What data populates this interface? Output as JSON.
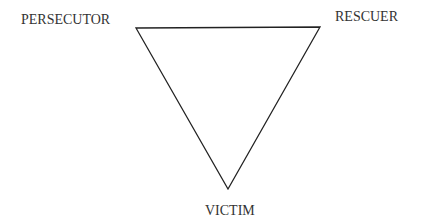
{
  "diagram": {
    "type": "drama-triangle",
    "nodes": [
      {
        "id": "persecutor",
        "label": "PERSECUTOR",
        "position": "top-left"
      },
      {
        "id": "rescuer",
        "label": "RESCUER",
        "position": "top-right"
      },
      {
        "id": "victim",
        "label": "VICTIM",
        "position": "bottom"
      }
    ],
    "edges": [
      {
        "from": "persecutor",
        "to": "rescuer"
      },
      {
        "from": "rescuer",
        "to": "victim"
      },
      {
        "from": "victim",
        "to": "persecutor"
      }
    ],
    "stroke_color": "#222222"
  }
}
